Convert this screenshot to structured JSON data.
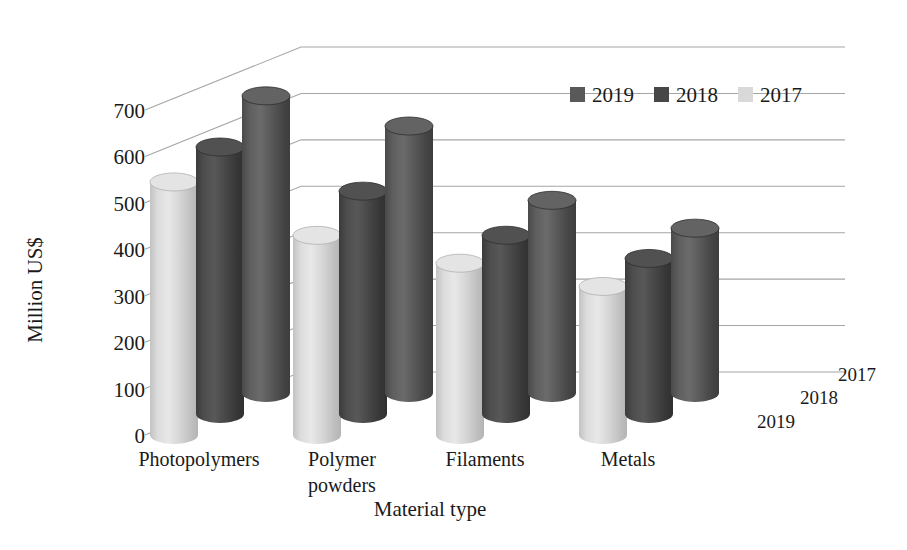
{
  "chart_data": {
    "type": "bar",
    "subtype": "3d-clustered-cylinder",
    "title": "",
    "xlabel": "Material type",
    "ylabel": "Million US$",
    "zlabel": "",
    "categories": [
      "Photopolymers",
      "Polymer powders",
      "Filaments",
      "Metals"
    ],
    "category_lines": [
      [
        "Photopolymers"
      ],
      [
        "Polymer",
        "powders"
      ],
      [
        "Filaments"
      ],
      [
        "Metals"
      ]
    ],
    "series": [
      {
        "name": "2019",
        "color": "#595959",
        "values": [
          640,
          575,
          415,
          355
        ]
      },
      {
        "name": "2018",
        "color": "#474747",
        "values": [
          575,
          480,
          385,
          335
        ]
      },
      {
        "name": "2017",
        "color": "#d9d9d9",
        "values": [
          545,
          430,
          370,
          320
        ]
      }
    ],
    "depth_axis_labels": [
      "2017",
      "2018",
      "2019"
    ],
    "ylim": [
      0,
      700
    ],
    "ytick_step": 100,
    "yticks": [
      "0",
      "100",
      "200",
      "300",
      "400",
      "500",
      "600",
      "700"
    ],
    "grid": true,
    "legend_position": "top-right",
    "legend_entries": [
      {
        "label": "2019",
        "color": "#595959"
      },
      {
        "label": "2018",
        "color": "#474747"
      },
      {
        "label": "2017",
        "color": "#d9d9d9"
      }
    ]
  }
}
